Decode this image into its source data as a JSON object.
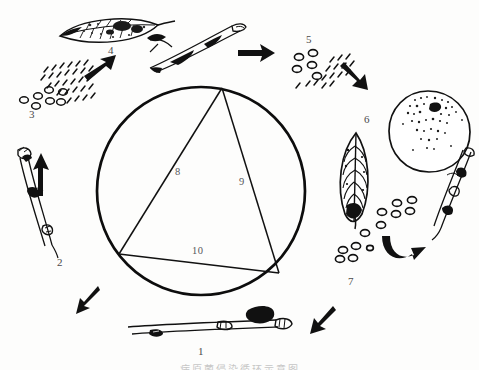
{
  "figure": {
    "kind": "disease-cycle-diagram",
    "title_caption": "病原菌侵染循环示意图",
    "background_color": "#fdfdfc",
    "ink_color": "#111111"
  },
  "circle": {
    "label": "central-circle",
    "cx": 201,
    "cy": 191,
    "r": 104,
    "stroke_width": 2.6
  },
  "triangle": {
    "label": "inscribed-triangle",
    "vertices": [
      {
        "name": "apex-top",
        "x": 222,
        "y": 88
      },
      {
        "name": "vertex-left",
        "x": 119,
        "y": 254
      },
      {
        "name": "vertex-right",
        "x": 279,
        "y": 273
      }
    ],
    "sides": [
      {
        "id": "8",
        "label": "8",
        "label_x": 177,
        "label_y": 172
      },
      {
        "id": "9",
        "label": "9",
        "label_x": 241,
        "label_y": 182
      },
      {
        "id": "10",
        "label": "10",
        "label_x": 196,
        "label_y": 251
      }
    ]
  },
  "stage_labels": [
    {
      "id": "1",
      "label": "1",
      "x": 200,
      "y": 351,
      "item": "overwintering-twig"
    },
    {
      "id": "2",
      "label": "2",
      "x": 59,
      "y": 261,
      "item": "infected-shoot"
    },
    {
      "id": "3",
      "label": "3",
      "x": 31,
      "y": 112,
      "item": "spore-mass-left"
    },
    {
      "id": "4",
      "label": "4",
      "x": 110,
      "y": 49,
      "item": "diseased-leaf-top"
    },
    {
      "id": "5",
      "label": "5",
      "x": 308,
      "y": 38,
      "item": "spore-mass-top-right"
    },
    {
      "id": "6",
      "label": "6",
      "x": 366,
      "y": 118,
      "item": "diseased-leaf-right"
    },
    {
      "id": "7",
      "label": "7",
      "x": 350,
      "y": 280,
      "item": "spore-mass-lower-right"
    }
  ],
  "arrows": [
    {
      "name": "arrow-upper-left",
      "direction": "up-right",
      "x": 98,
      "y": 62
    },
    {
      "name": "arrow-top-center",
      "direction": "right",
      "x": 252,
      "y": 52
    },
    {
      "name": "arrow-upper-right",
      "direction": "down-right",
      "x": 356,
      "y": 75
    },
    {
      "name": "arrow-lower-right-hook",
      "direction": "hook-up-right",
      "x": 395,
      "y": 249
    },
    {
      "name": "arrow-bottom-right",
      "direction": "down-left",
      "x": 325,
      "y": 320
    },
    {
      "name": "arrow-bottom-left",
      "direction": "up-left",
      "x": 92,
      "y": 298
    },
    {
      "name": "arrow-left",
      "direction": "up",
      "x": 39,
      "y": 158
    }
  ],
  "specimens": [
    {
      "name": "diseased-leaf-top",
      "type": "leaf",
      "x": 57,
      "y": 16,
      "w": 118,
      "h": 34
    },
    {
      "name": "lesioned-twig-top",
      "type": "twig",
      "x": 146,
      "y": 18,
      "w": 106,
      "h": 50
    },
    {
      "name": "spore-mass-left",
      "type": "spores",
      "x": 14,
      "y": 58,
      "w": 86,
      "h": 52
    },
    {
      "name": "spore-mass-top-right",
      "type": "spores",
      "x": 288,
      "y": 45,
      "w": 80,
      "h": 50
    },
    {
      "name": "spotted-fruit",
      "type": "fruit",
      "x": 385,
      "y": 88,
      "w": 86,
      "h": 86
    },
    {
      "name": "diseased-leaf-right",
      "type": "leaf",
      "x": 340,
      "y": 132,
      "w": 34,
      "h": 92
    },
    {
      "name": "lesioned-twig-right",
      "type": "twig",
      "x": 432,
      "y": 152,
      "w": 44,
      "h": 90
    },
    {
      "name": "spore-mass-lower-right",
      "type": "spores",
      "x": 330,
      "y": 196,
      "w": 84,
      "h": 68
    },
    {
      "name": "infected-shoot-left",
      "type": "twig",
      "x": 12,
      "y": 146,
      "w": 42,
      "h": 110
    },
    {
      "name": "overwintering-twig-bottom",
      "type": "twig",
      "x": 125,
      "y": 318,
      "w": 160,
      "h": 26
    }
  ]
}
